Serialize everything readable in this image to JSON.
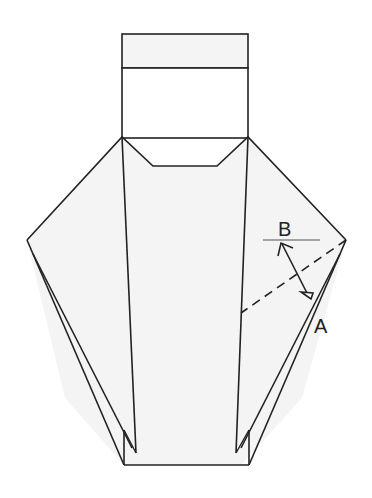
{
  "diagram": {
    "type": "origami-fold-step",
    "labels": {
      "A": "A",
      "B": "B"
    },
    "colors": {
      "stroke": "#222222",
      "paper": "#f4f4f4",
      "background": "#ffffff",
      "reference_line": "#888888"
    },
    "elements": [
      "top-flap-rectangle",
      "central-body",
      "left-wing",
      "right-wing",
      "dashed-fold-line",
      "double-arrow",
      "label-A",
      "label-B"
    ]
  }
}
